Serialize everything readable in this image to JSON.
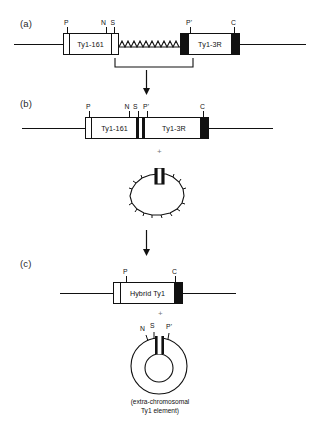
{
  "figure": {
    "type": "molecular-biology-schematic",
    "background_color": "#ffffff",
    "line_color": "#111111",
    "fill_solid_color": "#111111",
    "fill_open_color": "#ffffff"
  },
  "panels": [
    {
      "letter": "(a)",
      "description": "Two Ty1 elements on a chromosome separated by a zigzag region; bracket marks recombination interval",
      "elements": [
        {
          "name": "Ty1-161",
          "label": "Ty1-161",
          "left_ltr": "open",
          "right_ltr": "open"
        },
        {
          "name": "Ty1-3R",
          "label": "Ty1-3R",
          "left_ltr": "solid",
          "right_ltr": "solid"
        }
      ],
      "site_labels": [
        "P",
        "N",
        "S",
        "P'",
        "C"
      ]
    },
    {
      "letter": "(b)",
      "description": "Recombined single chromosomal element fusing Ty1-161 and Ty1-3R",
      "elements": [
        {
          "name": "Ty1-161",
          "label": "Ty1-161",
          "left_ltr": "open",
          "right_ltr": "solid-bar"
        },
        {
          "name": "Ty1-3R",
          "label": "Ty1-3R",
          "left_ltr": "solid-bar",
          "right_ltr": "solid"
        }
      ],
      "site_labels": [
        "P",
        "N",
        "S",
        "P'",
        "C"
      ]
    },
    {
      "letter": "(c)",
      "description": "Final hybrid chromosomal element",
      "elements": [
        {
          "name": "Hybrid Ty1",
          "label": "Hybrid Ty1",
          "left_ltr": "open",
          "right_ltr": "solid"
        }
      ],
      "site_labels": [
        "P",
        "C"
      ]
    }
  ],
  "intermediate_loop": {
    "name": "excised-circle-intermediate",
    "shape": "irregular-polygon-loop",
    "has_marker_box": true
  },
  "extrachromosomal": {
    "name": "extra-chromosomal-ty1-circle",
    "shape": "circle-with-inner-circle",
    "site_labels": [
      "N",
      "S",
      "P'"
    ],
    "caption": "(extra-chromosomal\nTy1 element)"
  },
  "labels": {
    "panel_a": "(a)",
    "panel_b": "(b)",
    "panel_c": "(c)",
    "ty1_161": "Ty1-161",
    "ty1_3r": "Ty1-3R",
    "hybrid_ty1": "Hybrid Ty1",
    "site_p": "P",
    "site_n": "N",
    "site_s": "S",
    "site_p_prime": "P'",
    "site_c": "C",
    "plus": "+",
    "caption_extrachromosomal": "(extra-chromosomal\nTy1 element)"
  },
  "icons": {
    "down_arrow": "down-arrow-icon",
    "bracket": "span-bracket-icon",
    "zigzag": "zigzag-recombination-icon"
  }
}
